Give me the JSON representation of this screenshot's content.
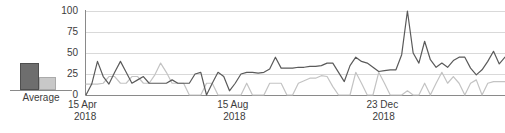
{
  "legend": {
    "label": "Average",
    "bars": [
      {
        "name": "current-average-bar",
        "color": "#6e6e6e",
        "value": 27
      },
      {
        "name": "previous-average-bar",
        "color": "#c8c8c8",
        "value": 13
      }
    ]
  },
  "chart_data": {
    "type": "line",
    "title": "",
    "xlabel": "",
    "ylabel": "",
    "ylim": [
      0,
      100
    ],
    "yticks": [
      0,
      25,
      50,
      75,
      100
    ],
    "grid": true,
    "legend_position": "left",
    "xticks": [
      {
        "line1": "15 Apr",
        "line2": "2018",
        "index": 0
      },
      {
        "line1": "15 Aug",
        "line2": "2018",
        "index": 26
      },
      {
        "line1": "23 Dec",
        "line2": "2018",
        "index": 52
      }
    ],
    "series": [
      {
        "name": "Current period",
        "color": "#5a5a5a",
        "values": [
          0,
          13,
          40,
          22,
          13,
          27,
          40,
          27,
          14,
          18,
          22,
          14,
          14,
          14,
          14,
          18,
          14,
          14,
          14,
          25,
          27,
          0,
          14,
          27,
          22,
          5,
          14,
          25,
          27,
          27,
          26,
          27,
          31,
          45,
          32,
          32,
          32,
          33,
          33,
          34,
          34,
          35,
          38,
          38,
          27,
          16,
          35,
          45,
          40,
          38,
          33,
          28,
          29,
          30,
          30,
          48,
          100,
          50,
          38,
          64,
          42,
          33,
          38,
          33,
          41,
          45,
          45,
          32,
          24,
          30,
          40,
          52,
          37,
          45
        ]
      },
      {
        "name": "Previous period",
        "color": "#c3c3c3",
        "values": [
          13,
          13,
          13,
          14,
          22,
          22,
          14,
          14,
          22,
          22,
          14,
          14,
          24,
          38,
          27,
          14,
          14,
          14,
          0,
          0,
          0,
          14,
          14,
          0,
          0,
          0,
          0,
          0,
          14,
          0,
          0,
          0,
          14,
          14,
          14,
          0,
          0,
          14,
          17,
          20,
          20,
          23,
          22,
          10,
          0,
          0,
          0,
          27,
          14,
          0,
          0,
          27,
          14,
          0,
          0,
          0,
          5,
          0,
          0,
          14,
          0,
          14,
          27,
          14,
          22,
          14,
          0,
          14,
          18,
          0,
          14,
          16,
          16,
          16
        ]
      }
    ]
  }
}
